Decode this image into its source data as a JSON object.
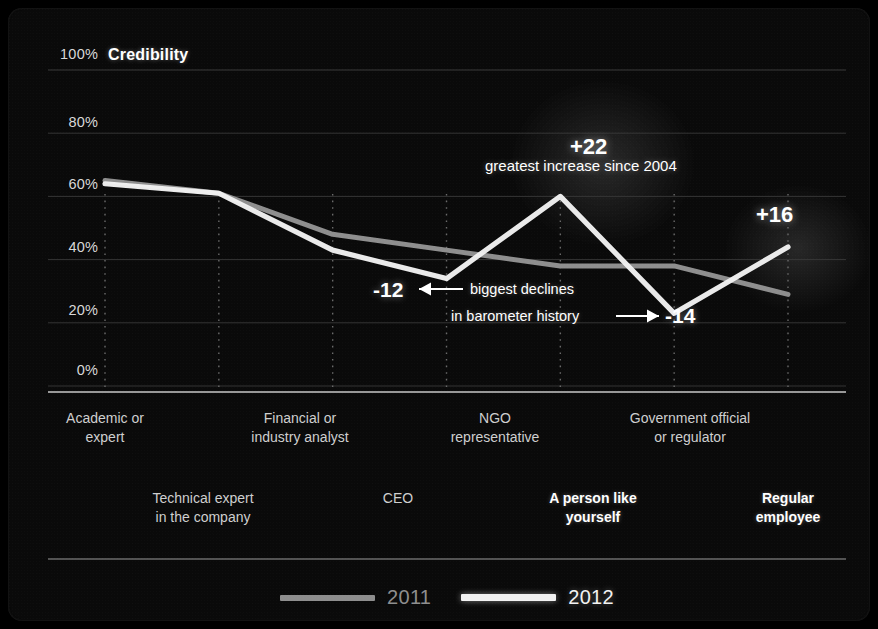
{
  "header": {
    "title": "Credibility"
  },
  "axes": {
    "y_ticks": [
      "100%",
      "80%",
      "60%",
      "40%",
      "20%",
      "0%"
    ],
    "x_top_labels": [
      "Academic or\nexpert",
      "Financial or\nindustry analyst",
      "NGO\nrepresentative",
      "Government official\nor regulator"
    ],
    "x_bottom_labels": [
      "Technical expert\nin the company",
      "CEO",
      "A person like\nyourself",
      "Regular\nemployee"
    ]
  },
  "legend": [
    {
      "label": "2011",
      "color": "#8e8e8e"
    },
    {
      "label": "2012",
      "color": "#f2f2f2"
    }
  ],
  "annotations": [
    {
      "name": "increase-ngo",
      "value": "+22",
      "text": "greatest increase since 2004"
    },
    {
      "name": "decline-ceo",
      "value": "-12",
      "text": "biggest declines"
    },
    {
      "name": "decline-government",
      "value": "-14",
      "text": "in barometer history"
    },
    {
      "name": "increase-regular-employee",
      "value": "+16",
      "text": ""
    }
  ],
  "colors": {
    "background": "#0a0a0a",
    "series_2011": "#8e8e8e",
    "series_2012": "#f2f2f2",
    "gridline": "#3a3a3a",
    "tickline": "#6a6a6a",
    "axis": "#cccccc"
  },
  "chart_data": {
    "type": "line",
    "title": "Credibility",
    "xlabel": "",
    "ylabel": "Credibility",
    "ylim": [
      0,
      100
    ],
    "ytick_values": [
      0,
      20,
      40,
      60,
      80,
      100
    ],
    "grid": true,
    "legend_position": "bottom-center",
    "categories": [
      "Academic or expert",
      "Technical expert in the company",
      "Financial or industry analyst",
      "CEO",
      "NGO representative",
      "Government official or regulator",
      "Regular employee"
    ],
    "series": [
      {
        "name": "2011",
        "color": "#8e8e8e",
        "values": [
          65,
          61,
          48,
          43,
          38,
          38,
          29
        ]
      },
      {
        "name": "2012",
        "color": "#f2f2f2",
        "values": [
          64,
          61,
          43,
          34,
          60,
          23,
          44
        ]
      }
    ],
    "annotations": [
      {
        "label": "+22",
        "note": "greatest increase since 2004",
        "category": "NGO representative"
      },
      {
        "label": "-12",
        "note": "biggest declines in barometer history",
        "category": "CEO"
      },
      {
        "label": "-14",
        "note": "biggest declines in barometer history",
        "category": "Government official or regulator"
      },
      {
        "label": "+16",
        "note": "",
        "category": "Regular employee"
      }
    ]
  }
}
